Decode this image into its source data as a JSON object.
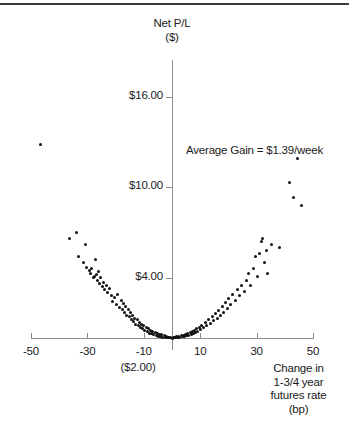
{
  "chart_data": {
    "type": "scatter",
    "title": "",
    "ylabel": "Net P/L ($)",
    "ylabel_line1": "Net P/L",
    "ylabel_line2": "($)",
    "xlabel": "Change in 1-3/4 year futures rate (bp)",
    "xlabel_line1": "Change in",
    "xlabel_line2": "1-3/4 year",
    "xlabel_line3": "futures rate",
    "xlabel_line4": "(bp)",
    "annotation": "Average Gain = $1.39/week",
    "grid": false,
    "legend": "none",
    "xlim": [
      -50,
      50
    ],
    "ylim": [
      -2,
      18
    ],
    "x_ticks": [
      -50,
      -30,
      -10,
      10,
      30,
      50
    ],
    "x_tick_labels": [
      "-50",
      "-30",
      "-10",
      "10",
      "30",
      "50"
    ],
    "y_ticks": [
      4,
      10,
      16
    ],
    "y_tick_labels": [
      "$4.00",
      "$10.00",
      "$16.00"
    ],
    "y_origin_label": "($2.00)",
    "point_color": "#111111",
    "axis_color": "#8d8d8d",
    "points": [
      [
        -46.8,
        12.8
      ],
      [
        -36.5,
        6.6
      ],
      [
        -34.0,
        7.0
      ],
      [
        -33.2,
        5.4
      ],
      [
        -31.4,
        5.0
      ],
      [
        -30.6,
        6.2
      ],
      [
        -30.2,
        4.7
      ],
      [
        -29.4,
        4.5
      ],
      [
        -28.9,
        4.3
      ],
      [
        -28.4,
        4.6
      ],
      [
        -28.0,
        4.0
      ],
      [
        -27.6,
        4.1
      ],
      [
        -27.2,
        5.2
      ],
      [
        -26.8,
        4.2
      ],
      [
        -26.4,
        3.8
      ],
      [
        -26.0,
        4.4
      ],
      [
        -25.6,
        3.6
      ],
      [
        -25.2,
        4.0
      ],
      [
        -24.8,
        3.4
      ],
      [
        -24.4,
        3.7
      ],
      [
        -24.0,
        3.2
      ],
      [
        -23.4,
        3.5
      ],
      [
        -22.8,
        3.0
      ],
      [
        -22.2,
        3.3
      ],
      [
        -21.6,
        2.8
      ],
      [
        -21.0,
        2.4
      ],
      [
        -20.4,
        2.7
      ],
      [
        -19.8,
        2.2
      ],
      [
        -19.2,
        2.9
      ],
      [
        -18.6,
        2.0
      ],
      [
        -18.0,
        2.5
      ],
      [
        -17.6,
        1.9
      ],
      [
        -17.2,
        2.3
      ],
      [
        -16.8,
        1.7
      ],
      [
        -16.4,
        2.1
      ],
      [
        -16.0,
        1.5
      ],
      [
        -15.6,
        1.9
      ],
      [
        -15.2,
        1.4
      ],
      [
        -14.8,
        1.7
      ],
      [
        -14.4,
        1.2
      ],
      [
        -14.0,
        1.5
      ],
      [
        -13.6,
        1.1
      ],
      [
        -13.2,
        1.3
      ],
      [
        -12.8,
        0.9
      ],
      [
        -12.4,
        1.2
      ],
      [
        -12.0,
        0.8
      ],
      [
        -11.6,
        1.0
      ],
      [
        -11.2,
        0.7
      ],
      [
        -10.8,
        0.9
      ],
      [
        -10.4,
        0.6
      ],
      [
        -10.0,
        0.8
      ],
      [
        -9.6,
        0.5
      ],
      [
        -9.2,
        0.7
      ],
      [
        -8.8,
        0.4
      ],
      [
        -8.4,
        0.6
      ],
      [
        -8.0,
        0.3
      ],
      [
        -7.6,
        0.5
      ],
      [
        -7.2,
        0.3
      ],
      [
        -6.8,
        0.4
      ],
      [
        -6.4,
        0.2
      ],
      [
        -6.0,
        0.35
      ],
      [
        -5.6,
        0.15
      ],
      [
        -5.2,
        0.3
      ],
      [
        -4.8,
        0.1
      ],
      [
        -4.4,
        0.25
      ],
      [
        -4.0,
        0.08
      ],
      [
        -3.6,
        0.2
      ],
      [
        -3.2,
        0.05
      ],
      [
        -2.8,
        0.15
      ],
      [
        -2.4,
        0.03
      ],
      [
        -2.0,
        0.1
      ],
      [
        -1.6,
        0.02
      ],
      [
        -1.2,
        0.06
      ],
      [
        -0.8,
        0.01
      ],
      [
        -0.4,
        0.04
      ],
      [
        0.0,
        0.0
      ],
      [
        0.4,
        0.02
      ],
      [
        0.8,
        0.05
      ],
      [
        1.2,
        0.01
      ],
      [
        1.6,
        0.08
      ],
      [
        2.0,
        0.03
      ],
      [
        2.4,
        0.1
      ],
      [
        2.8,
        0.05
      ],
      [
        3.2,
        0.14
      ],
      [
        3.6,
        0.08
      ],
      [
        4.0,
        0.18
      ],
      [
        4.4,
        0.1
      ],
      [
        4.8,
        0.22
      ],
      [
        5.2,
        0.14
      ],
      [
        5.6,
        0.28
      ],
      [
        6.0,
        0.18
      ],
      [
        6.4,
        0.34
      ],
      [
        6.8,
        0.22
      ],
      [
        7.2,
        0.4
      ],
      [
        7.6,
        0.3
      ],
      [
        8.0,
        0.5
      ],
      [
        8.4,
        0.36
      ],
      [
        8.8,
        0.6
      ],
      [
        9.2,
        0.45
      ],
      [
        9.6,
        0.72
      ],
      [
        10.0,
        0.55
      ],
      [
        10.6,
        0.85
      ],
      [
        11.2,
        0.68
      ],
      [
        11.8,
        1.0
      ],
      [
        12.4,
        0.8
      ],
      [
        13.0,
        1.2
      ],
      [
        13.6,
        0.95
      ],
      [
        14.2,
        1.4
      ],
      [
        14.8,
        1.15
      ],
      [
        15.4,
        1.6
      ],
      [
        16.0,
        1.3
      ],
      [
        16.6,
        1.85
      ],
      [
        17.2,
        1.5
      ],
      [
        17.8,
        2.1
      ],
      [
        18.4,
        1.7
      ],
      [
        19.0,
        2.35
      ],
      [
        19.6,
        1.95
      ],
      [
        20.2,
        2.6
      ],
      [
        20.8,
        2.2
      ],
      [
        21.6,
        2.9
      ],
      [
        22.4,
        2.5
      ],
      [
        23.2,
        3.2
      ],
      [
        24.0,
        2.8
      ],
      [
        24.8,
        3.5
      ],
      [
        25.6,
        3.1
      ],
      [
        26.4,
        3.8
      ],
      [
        27.2,
        4.3
      ],
      [
        28.0,
        3.5
      ],
      [
        28.8,
        4.6
      ],
      [
        29.6,
        5.4
      ],
      [
        30.4,
        4.1
      ],
      [
        31.2,
        5.6
      ],
      [
        31.8,
        6.4
      ],
      [
        32.2,
        6.6
      ],
      [
        32.8,
        5.0
      ],
      [
        33.4,
        5.8
      ],
      [
        34.0,
        4.3
      ],
      [
        35.2,
        6.2
      ],
      [
        38.0,
        6.0
      ],
      [
        41.8,
        10.3
      ],
      [
        43.0,
        9.3
      ],
      [
        44.6,
        11.9
      ],
      [
        46.0,
        8.8
      ]
    ]
  }
}
